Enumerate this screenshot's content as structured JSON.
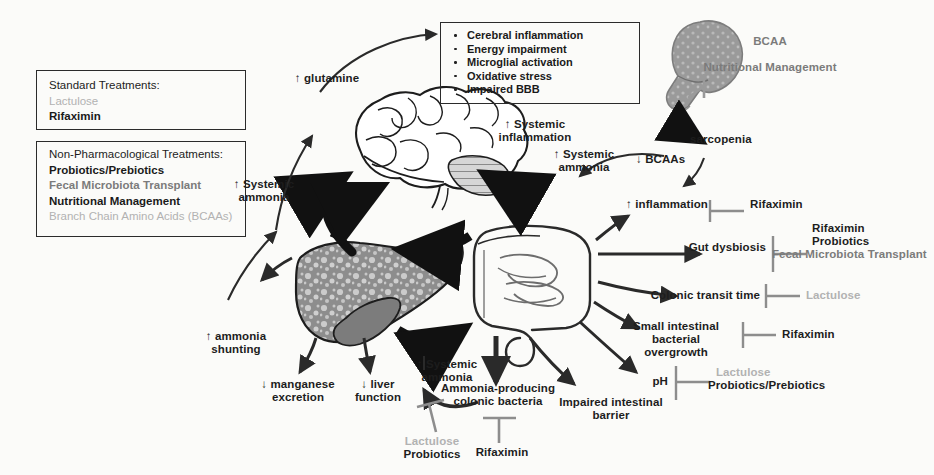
{
  "figure": {
    "background": "#fbfbf9",
    "colors": {
      "ink": "#1d1d1d",
      "gray_drug": "#b2b2b2",
      "mid_gray": "#7b7b7b",
      "organ_fill": "#8f8f8f",
      "nodule_fill": "#c9c9c9"
    }
  },
  "legend_boxes": [
    {
      "id": "standard-treatments",
      "header": "Standard Treatments:",
      "items": [
        {
          "label": "Lactulose",
          "style": "gray"
        },
        {
          "label": "Rifaximin",
          "style": "bold"
        }
      ]
    },
    {
      "id": "non-pharmacological-treatments",
      "header": "Non-Pharmacological Treatments:",
      "items": [
        {
          "label": "Probiotics/Prebiotics",
          "style": "bold"
        },
        {
          "label": "Fecal Microbiota Transplant",
          "style": "mid"
        },
        {
          "label": "Nutritional Management",
          "style": "bold"
        },
        {
          "label": "Branch Chain Amino Acids (BCAAs)",
          "style": "gray"
        }
      ]
    }
  ],
  "brain_effects_box": {
    "items": [
      "Cerebral inflammation",
      "Energy impairment",
      "Microglial activation",
      "Oxidative stress",
      "Impaired BBB"
    ]
  },
  "organs": [
    {
      "id": "brain",
      "label": "brain"
    },
    {
      "id": "liver",
      "label": "cirrhotic liver"
    },
    {
      "id": "intestine",
      "label": "intestine"
    },
    {
      "id": "muscle",
      "label": "skeletal muscle"
    }
  ],
  "flow_labels": [
    {
      "id": "glutamine",
      "text": "↑ glutamine"
    },
    {
      "id": "systemic-ammonia-left",
      "text": "↑ Systemic\nammonia"
    },
    {
      "id": "systemic-inflammation",
      "text": "↑ Systemic\ninflammation"
    },
    {
      "id": "systemic-ammonia-mid",
      "text": "↑ Systemic\nammonia"
    },
    {
      "id": "systemic-ammonia-bottom",
      "text": "↑ Systemic\nammonia"
    },
    {
      "id": "ammonia-shunting",
      "text": "↑ ammonia\nshunting"
    },
    {
      "id": "manganese-excretion",
      "text": "↓ manganese\nexcretion"
    },
    {
      "id": "liver-function",
      "text": "↓ liver\nfunction"
    },
    {
      "id": "sarcopenia",
      "text": "sarcopenia"
    },
    {
      "id": "bcaas-down",
      "text": "↓ BCAAs"
    },
    {
      "id": "ammonia-producing-bacteria",
      "text": "Ammonia-producing\ncolonic bacteria"
    },
    {
      "id": "impaired-intestinal-barrier",
      "text": "Impaired intestinal\nbarrier"
    }
  ],
  "gut_targets": [
    {
      "id": "inflammation",
      "target": "↑ inflammation",
      "drugs": [
        {
          "label": "Rifaximin",
          "style": "bold"
        }
      ]
    },
    {
      "id": "gut-dysbiosis",
      "target": "Gut dysbiosis",
      "drugs": [
        {
          "label": "Rifaximin",
          "style": "bold"
        },
        {
          "label": "Probiotics",
          "style": "bold"
        },
        {
          "label": "Fecal Microbiota Transplant",
          "style": "mid"
        }
      ]
    },
    {
      "id": "colonic-transit-time",
      "target": "Colonic transit time",
      "drugs": [
        {
          "label": "Lactulose",
          "style": "gray"
        }
      ]
    },
    {
      "id": "sibo",
      "target": "Small intestinal bacterial\novergrowth",
      "drugs": [
        {
          "label": "Rifaximin",
          "style": "bold"
        }
      ]
    },
    {
      "id": "ph",
      "target": "pH",
      "drugs": [
        {
          "label": "Lactulose",
          "style": "gray"
        },
        {
          "label": "Probiotics/Prebiotics",
          "style": "bold"
        }
      ]
    }
  ],
  "bottom_inhibitors": [
    {
      "id": "systemic-ammonia-inhibitor",
      "drugs": [
        {
          "label": "Lactulose",
          "style": "gray"
        },
        {
          "label": "Probiotics",
          "style": "bold"
        }
      ]
    },
    {
      "id": "colonic-bacteria-inhibitor",
      "drugs": [
        {
          "label": "Rifaximin",
          "style": "bold"
        }
      ]
    }
  ],
  "bcaa_note": {
    "id": "bcaa-nutritional-management",
    "line1": "BCAA",
    "line2": "Nutritional Management"
  }
}
